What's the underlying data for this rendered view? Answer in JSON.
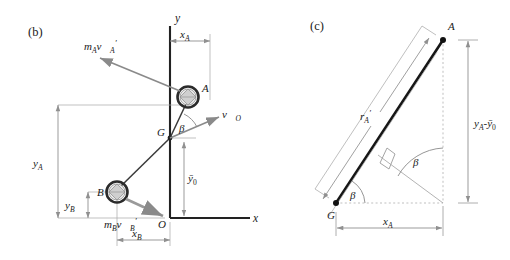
{
  "figure": {
    "title_b": "(b)",
    "title_c": "(c)",
    "background_color": "#ffffff",
    "ink_color": "#1a1a1a",
    "thin_line_color": "#8a8a8a",
    "dashed_line_color": "#b0b0b0"
  },
  "panel_b": {
    "tag": "(b)",
    "axes": {
      "y_label": "y",
      "x_label": "x",
      "origin_label": "O",
      "origin_px": [
        170,
        218
      ],
      "y_axis_top_px": [
        170,
        26
      ],
      "x_axis_right_px": [
        248,
        218
      ]
    },
    "points": [
      {
        "name": "A",
        "label": "A",
        "px": [
          188,
          97
        ],
        "style": "hatched-circle"
      },
      {
        "name": "B",
        "label": "B",
        "px": [
          117,
          192
        ],
        "style": "hatched-circle"
      },
      {
        "name": "G",
        "label": "G",
        "px": [
          170,
          138
        ],
        "style": "dot"
      }
    ],
    "vectors": [
      {
        "name": "momentum-A",
        "label": "m_A v'_A",
        "label_parts": {
          "m": "m",
          "m_sub": "A",
          "v": "v⃗",
          "v_sub": "A",
          "prime": "′"
        },
        "from_px": [
          180,
          90
        ],
        "to_px": [
          98,
          57
        ],
        "label_px": [
          86,
          48
        ]
      },
      {
        "name": "momentum-B",
        "label": "m_B v'_B",
        "label_parts": {
          "m": "m",
          "m_sub": "B",
          "v": "v⃗",
          "v_sub": "B",
          "prime": "′"
        },
        "from_px": [
          126,
          198
        ],
        "to_px": [
          160,
          214
        ],
        "label_px": [
          108,
          222
        ]
      },
      {
        "name": "velocity-O",
        "label": "v̄_O",
        "label_parts": {
          "v": "v⃗",
          "v_sub": "O"
        },
        "from_px": [
          170,
          138
        ],
        "to_px": [
          222,
          116
        ],
        "label_px": [
          225,
          116
        ]
      }
    ],
    "angle": {
      "name": "beta",
      "label": "β",
      "vertex_px": [
        170,
        138
      ],
      "label_px": [
        180,
        127
      ]
    },
    "dimensions": [
      {
        "name": "y_A",
        "label": "y_A",
        "base": "y",
        "sub": "A",
        "orientation": "vertical",
        "line_px": [
          58,
          105,
          58,
          218
        ]
      },
      {
        "name": "y_B",
        "label": "y_B",
        "base": "y",
        "sub": "B",
        "orientation": "vertical",
        "line_px": [
          88,
          192,
          88,
          218
        ]
      },
      {
        "name": "y_bar_0",
        "label": "ȳ_0",
        "base": "ȳ",
        "sub": "0",
        "orientation": "vertical",
        "line_px": [
          170,
          138,
          170,
          218
        ],
        "offset_x": 14
      },
      {
        "name": "x_A",
        "label": "x_A",
        "base": "x",
        "sub": "A",
        "orientation": "horizontal",
        "line_px": [
          170,
          41,
          210,
          41
        ]
      },
      {
        "name": "x_B",
        "label": "x_B",
        "base": "x",
        "sub": "B",
        "orientation": "horizontal",
        "line_px": [
          117,
          240,
          170,
          240
        ]
      }
    ]
  },
  "panel_c": {
    "tag": "(c)",
    "points": [
      {
        "name": "A",
        "label": "A",
        "px": [
          443,
          40
        ],
        "style": "dot"
      },
      {
        "name": "G",
        "label": "G",
        "px": [
          336,
          203
        ],
        "style": "dot"
      }
    ],
    "segment": {
      "name": "r-prime-A",
      "label": "r'_A",
      "base": "r",
      "sub": "A",
      "prime": "′",
      "from_px": [
        336,
        203
      ],
      "to_px": [
        443,
        40
      ],
      "label_px": [
        370,
        116
      ]
    },
    "angles": [
      {
        "name": "beta-at-G",
        "label": "β",
        "vertex_px": [
          336,
          203
        ],
        "label_px": [
          353,
          193
        ]
      },
      {
        "name": "beta-at-corner",
        "label": "β",
        "vertex_px": [
          443,
          203
        ],
        "label_px": [
          414,
          150
        ]
      }
    ],
    "right_angle": {
      "name": "right-angle-mark",
      "px": [
        391,
        157
      ]
    },
    "dimensions": [
      {
        "name": "y_A_minus_y_bar_0",
        "label": "y_A - ȳ_0",
        "parts": {
          "y1": "y",
          "s1": "A",
          "minus": "-",
          "y2": "ȳ",
          "s2": "0"
        },
        "orientation": "vertical",
        "line_px": [
          467,
          40,
          467,
          203
        ]
      },
      {
        "name": "x_A",
        "label": "x_A",
        "base": "x",
        "sub": "A",
        "orientation": "horizontal",
        "line_px": [
          336,
          228,
          443,
          228
        ]
      }
    ]
  }
}
